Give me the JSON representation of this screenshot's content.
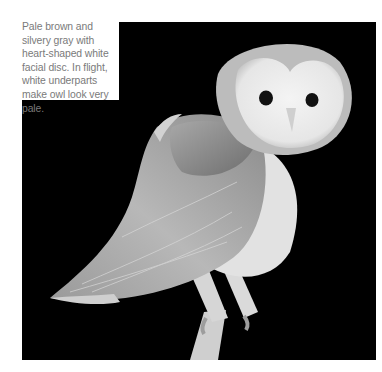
{
  "caption": {
    "text": "Pale brown and silvery gray with heart-shaped white facial disc. In flight, white underparts make owl look very pale."
  },
  "photo": {
    "subject": "barn-owl",
    "background_color": "#000000",
    "tone": "grayscale"
  }
}
